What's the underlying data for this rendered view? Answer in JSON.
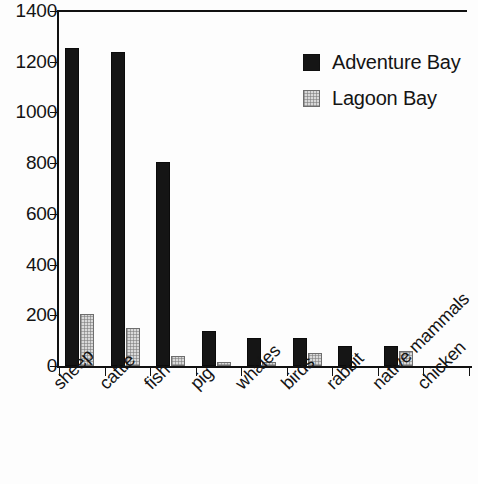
{
  "chart_data": {
    "type": "bar",
    "title": "",
    "subtitle": "",
    "xlabel": "",
    "ylabel": "",
    "ylim": [
      0,
      1400
    ],
    "yticks": [
      0,
      200,
      400,
      600,
      800,
      1000,
      1200,
      1400
    ],
    "ytick_labels": [
      "0",
      "200",
      "400",
      "600",
      "800",
      "1000",
      "1200",
      "1400"
    ],
    "grid": false,
    "legend_position": "top-right",
    "categories": [
      "sheep",
      "cattle",
      "fish",
      "pig",
      "whales",
      "birds",
      "rabbit",
      "native mammals",
      "chicken"
    ],
    "series": [
      {
        "name": "Adventure Bay",
        "color": "#151515",
        "values": [
          1255,
          1240,
          805,
          140,
          110,
          110,
          80,
          80,
          0
        ]
      },
      {
        "name": "Lagoon Bay",
        "color": "#d9d9d9",
        "values": [
          205,
          150,
          40,
          15,
          15,
          50,
          0,
          60,
          0
        ]
      }
    ]
  },
  "legend": {
    "entries": [
      {
        "label": "Adventure Bay",
        "swatch": "legend-swatch-black"
      },
      {
        "label": "Lagoon Bay",
        "swatch": "legend-swatch-gray"
      }
    ]
  }
}
